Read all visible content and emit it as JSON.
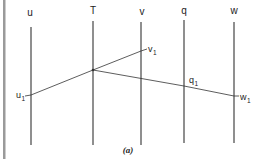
{
  "diagram": {
    "caption": "(a)",
    "axes": [
      {
        "id": "u",
        "label": "u",
        "x": 31,
        "y_top": 27,
        "y_bottom": 145,
        "label_x": 30,
        "label_y": 16
      },
      {
        "id": "T",
        "label": "T",
        "x": 93,
        "y_top": 21,
        "y_bottom": 145,
        "label_x": 93,
        "label_y": 14
      },
      {
        "id": "v",
        "label": "v",
        "x": 141,
        "y_top": 22,
        "y_bottom": 145,
        "label_x": 142,
        "label_y": 15
      },
      {
        "id": "q",
        "label": "q",
        "x": 184,
        "y_top": 20,
        "y_bottom": 143,
        "label_x": 184,
        "label_y": 14
      },
      {
        "id": "w",
        "label": "w",
        "x": 234,
        "y_top": 22,
        "y_bottom": 143,
        "label_x": 234,
        "label_y": 14
      }
    ],
    "pivot": {
      "x": 93,
      "y": 70
    },
    "points": [
      {
        "id": "u1",
        "label": "u",
        "sub": "1",
        "x": 31,
        "y": 95,
        "label_x": 16,
        "label_y": 98
      },
      {
        "id": "v1",
        "label": "v",
        "sub": "1",
        "x": 141,
        "y": 51,
        "label_x": 148,
        "label_y": 52
      },
      {
        "id": "q1",
        "label": "q",
        "sub": "1",
        "x": 184,
        "y": 86,
        "label_x": 189,
        "label_y": 83
      },
      {
        "id": "w1",
        "label": "w",
        "sub": "1",
        "x": 234,
        "y": 96,
        "label_x": 240,
        "label_y": 100
      }
    ],
    "colors": {
      "line": "#333333",
      "border": "#9a9a9a",
      "text": "#222222"
    }
  }
}
